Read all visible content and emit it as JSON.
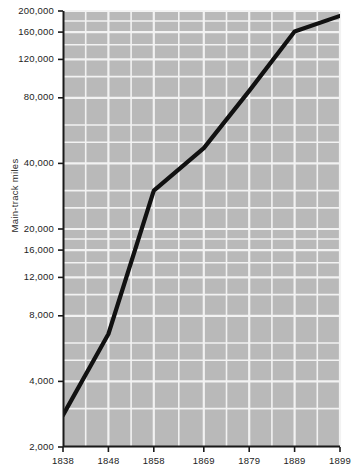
{
  "chart_data": {
    "type": "line",
    "title": "",
    "subtitle": "",
    "xlabel": "",
    "ylabel": "Main-track miles",
    "yscale": "log",
    "xscale": "linear",
    "grid": true,
    "legend": "none",
    "xlim": [
      1838,
      1899
    ],
    "ylim": [
      2000,
      200000
    ],
    "xticks": [
      1838,
      1848,
      1858,
      1869,
      1879,
      1889,
      1899
    ],
    "xticklabels": [
      "1838",
      "1848",
      "1858",
      "1869",
      "1879",
      "1889",
      "1899"
    ],
    "yticks": [
      2000,
      4000,
      8000,
      12000,
      16000,
      20000,
      40000,
      80000,
      120000,
      160000,
      200000
    ],
    "yticklabels": [
      "2,000",
      "4,000",
      "8,000",
      "12,000",
      "16,000",
      "20,000",
      "40,000",
      "80,000",
      "120,000",
      "160,000",
      "200,000"
    ],
    "series": [
      {
        "name": "Main-track miles",
        "x": [
          1838,
          1848,
          1858,
          1869,
          1879,
          1889,
          1899
        ],
        "values": [
          2800,
          6600,
          30000,
          47000,
          86000,
          161000,
          190000
        ],
        "color": "#111111"
      }
    ],
    "plot_background": "#b9b9b9",
    "gridline_color": "#f2f2f2",
    "axis_color": "#1a1a1a"
  }
}
